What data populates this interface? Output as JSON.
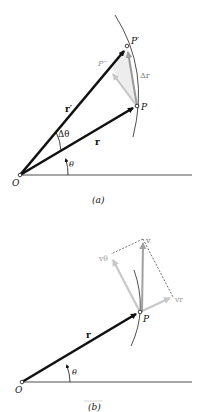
{
  "figure_a": {
    "caption": "(a)",
    "labels": {
      "origin": "O",
      "point_P": "P",
      "point_P_prime": "P′",
      "point_P_double_prime": "P′′",
      "r": "r",
      "r_prime": "r′",
      "delta_r": "Δr",
      "delta_theta": "Δθ",
      "theta": "θ"
    }
  },
  "figure_b": {
    "caption": "(b)",
    "labels": {
      "origin": "O",
      "point_P": "P",
      "r": "r",
      "v": "v",
      "v_theta": "vθ",
      "v_r": "vr",
      "theta": "θ"
    }
  },
  "colors": {
    "dark_vector": "#111111",
    "gray_vector": "#a8a8a8",
    "light_gray_vector": "#c8c8c8",
    "line": "#222222"
  }
}
